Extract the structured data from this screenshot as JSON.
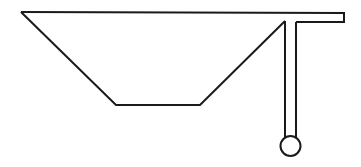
{
  "diagram": {
    "stroke_color": "#1a1a1a",
    "background": "#ffffff",
    "shapes": {
      "trapezoid": {
        "points": [
          [
            21,
            12
          ],
          [
            116,
            105
          ],
          [
            200,
            105
          ],
          [
            285,
            21
          ]
        ]
      },
      "top_bar": {
        "x1": 21,
        "y1": 12,
        "x2": 344,
        "y2": 13,
        "right_end_bottom": 22
      },
      "stem": {
        "x_left": 285,
        "x_right": 296,
        "y_top": 21,
        "y_bottom": 137
      },
      "knob": {
        "cx": 290.5,
        "cy": 146,
        "r": 10
      }
    }
  }
}
